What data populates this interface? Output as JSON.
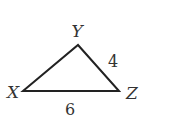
{
  "diagram": {
    "type": "triangle",
    "vertices": [
      {
        "id": "X",
        "label": "X",
        "x": 23,
        "y": 91
      },
      {
        "id": "Y",
        "label": "Y",
        "x": 78,
        "y": 45
      },
      {
        "id": "Z",
        "label": "Z",
        "x": 119,
        "y": 91
      }
    ],
    "sides": [
      {
        "from": "Y",
        "to": "Z",
        "label": "4"
      },
      {
        "from": "X",
        "to": "Z",
        "label": "6"
      }
    ],
    "stroke_color": "#222222"
  }
}
